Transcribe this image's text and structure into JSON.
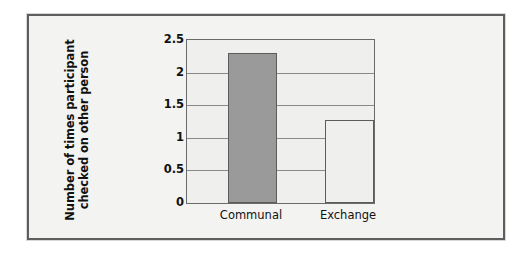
{
  "chart_data": {
    "type": "bar",
    "title": "",
    "xlabel": "",
    "ylabel_line1": "Number of times participant",
    "ylabel_line2": "checked on other person",
    "categories": [
      "Communal",
      "Exchange"
    ],
    "values": [
      2.3,
      1.27
    ],
    "series": [
      {
        "name": "Number of times participant checked on other person",
        "values": [
          2.3,
          1.27
        ]
      }
    ],
    "bar_styles": [
      "filled-gray",
      "hollow-white"
    ],
    "bar_colors": [
      "#9a9a9a",
      "#efefed"
    ],
    "bar_border_color": "#5c5c5c",
    "ylim": [
      0,
      2.5
    ],
    "yticks": [
      0,
      0.5,
      1,
      1.5,
      2,
      2.5
    ],
    "ytick_labels": [
      "0",
      "0.5",
      "1",
      "1.5",
      "2",
      "2.5"
    ],
    "grid": true,
    "grid_axis": "y",
    "grid_color": "#8a8a8a",
    "legend": false,
    "legend_position": "none",
    "plot_background": "#efefed",
    "figure_background": "#f3f3f1",
    "frame_color": "#5e5e5e"
  }
}
